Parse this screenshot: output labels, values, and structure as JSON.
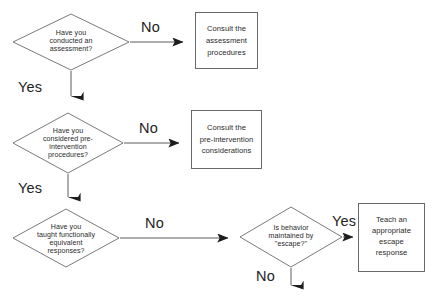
{
  "diagram": {
    "background_color": "#ffffff",
    "line_color": "#4a4a4a",
    "text_color": "#2a2a2a"
  },
  "nodes": {
    "decision_assessment": {
      "shape": "diamond",
      "lines": [
        "Have you",
        "conducted an",
        "assessment?"
      ]
    },
    "action_assessment": {
      "shape": "rectangle",
      "lines": [
        "Consult the",
        "assessment",
        "procedures"
      ]
    },
    "decision_preintervention": {
      "shape": "diamond",
      "lines": [
        "Have you",
        "considered pre-",
        "intervention",
        "procedures?"
      ]
    },
    "action_preintervention": {
      "shape": "rectangle",
      "lines": [
        "Consult the",
        "pre-intervention",
        "considerations"
      ]
    },
    "decision_functional_responses": {
      "shape": "diamond",
      "lines": [
        "Have you",
        "taught functionally",
        "equivalent",
        "responses?"
      ]
    },
    "decision_escape": {
      "shape": "diamond",
      "lines": [
        "Is behavior",
        "maintained by",
        "\"escape?\""
      ]
    },
    "action_escape": {
      "shape": "rectangle",
      "lines": [
        "Teach an",
        "appropriate",
        "escape",
        "response"
      ]
    }
  },
  "edges": {
    "assessment_no": "No",
    "assessment_yes": "Yes",
    "preintervention_no": "No",
    "preintervention_yes": "Yes",
    "functional_no": "No",
    "escape_yes": "Yes",
    "escape_no": "No"
  }
}
